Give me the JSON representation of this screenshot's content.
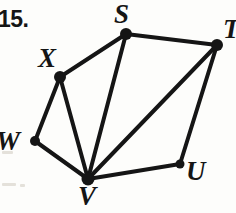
{
  "problem": {
    "number_label": "15."
  },
  "figure": {
    "stroke_color": "#151515",
    "background_color": "#fdfdfb",
    "edge_width": 4,
    "vertices": [
      {
        "id": "S",
        "label": "S",
        "x": 126,
        "y": 34,
        "r": 6.0,
        "label_x": 114,
        "label_y": 1,
        "font_size": 27
      },
      {
        "id": "T",
        "label": "T",
        "x": 217,
        "y": 45,
        "r": 6.0,
        "label_x": 223,
        "label_y": 16,
        "font_size": 27
      },
      {
        "id": "X",
        "label": "X",
        "x": 60,
        "y": 77,
        "r": 6.0,
        "label_x": 38,
        "label_y": 45,
        "font_size": 27
      },
      {
        "id": "W",
        "label": "W",
        "x": 35,
        "y": 141,
        "r": 5.0,
        "label_x": -4,
        "label_y": 128,
        "font_size": 27
      },
      {
        "id": "V",
        "label": "V",
        "x": 88,
        "y": 179,
        "r": 6.5,
        "label_x": 78,
        "label_y": 183,
        "font_size": 27
      },
      {
        "id": "U",
        "label": "U",
        "x": 180,
        "y": 164,
        "r": 4.5,
        "label_x": 186,
        "label_y": 158,
        "font_size": 27
      }
    ],
    "edges": [
      {
        "from": "S",
        "to": "T"
      },
      {
        "from": "S",
        "to": "X"
      },
      {
        "from": "S",
        "to": "V"
      },
      {
        "from": "T",
        "to": "V"
      },
      {
        "from": "T",
        "to": "U"
      },
      {
        "from": "U",
        "to": "V"
      },
      {
        "from": "X",
        "to": "W"
      },
      {
        "from": "X",
        "to": "V"
      },
      {
        "from": "W",
        "to": "V"
      }
    ]
  }
}
